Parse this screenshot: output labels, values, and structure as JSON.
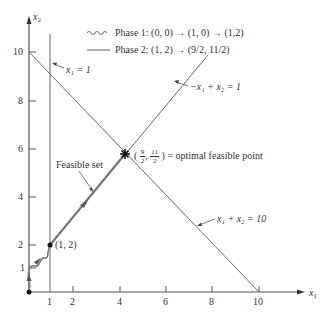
{
  "axes": {
    "x_label": "x",
    "x_label_sub": "1",
    "y_label": "x",
    "y_label_sub": "2",
    "x_ticks": [
      "1",
      "2",
      "4",
      "6",
      "8",
      "10"
    ],
    "y_ticks": [
      "1",
      "2",
      "4",
      "6",
      "8",
      "10"
    ]
  },
  "legend": {
    "phase1": "Phase 1: (0, 0) → (1, 0) → (1,2)",
    "phase2": "Phase 2: (1, 2) → (9/2, 11/2)"
  },
  "annotations": {
    "constraint_x1": "x₁ = 1",
    "constraint_diag": "−x₁ + x₂ = 1",
    "constraint_sum": "x₁ + x₂ = 10",
    "feasible_set": "Feasible set",
    "point_12": "(1, 2)",
    "optimal_open": "(",
    "optimal_num1": "9",
    "optimal_den1": "2",
    "optimal_num2": "11",
    "optimal_den2": "2",
    "optimal_close": ") = optimal feasible point"
  },
  "colors": {
    "line": "#555555",
    "path": "#777777",
    "text": "#333333"
  }
}
